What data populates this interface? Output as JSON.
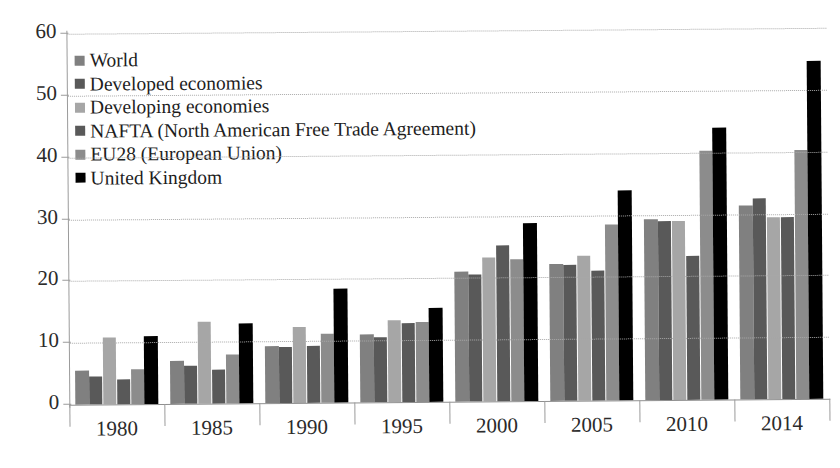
{
  "chart_data": {
    "type": "bar",
    "title": "",
    "subtitle": "",
    "xlabel": "",
    "ylabel": "",
    "ylim": [
      0,
      60
    ],
    "ytick_step": 10,
    "yticks": [
      "0",
      "10",
      "20",
      "30",
      "40",
      "50",
      "60"
    ],
    "grid": "horizontal-dotted",
    "legend_position": "inside-top-left",
    "categories": [
      "1980",
      "1985",
      "1990",
      "1995",
      "2000",
      "2005",
      "2010",
      "2014"
    ],
    "series": [
      {
        "name": "World",
        "color": "#808080",
        "values": [
          5.5,
          7.0,
          9.2,
          11.0,
          21.0,
          22.2,
          29.2,
          31.4
        ]
      },
      {
        "name": "Developed economies",
        "color": "#595959",
        "values": [
          4.6,
          6.2,
          9.0,
          10.5,
          20.5,
          22.0,
          29.0,
          32.5
        ]
      },
      {
        "name": "Developing economies",
        "color": "#a6a6a6",
        "values": [
          10.9,
          13.3,
          12.3,
          13.2,
          23.3,
          23.5,
          29.0,
          29.5
        ]
      },
      {
        "name": "NAFTA (North American Free Trade Agreement)",
        "color": "#595959",
        "values": [
          4.0,
          5.5,
          9.3,
          12.7,
          25.3,
          21.0,
          23.3,
          29.4
        ]
      },
      {
        "name": "EU28 (European Union)",
        "color": "#8c8c8c",
        "values": [
          5.6,
          8.0,
          11.2,
          13.0,
          23.0,
          28.5,
          40.3,
          40.3
        ]
      },
      {
        "name": "United Kingdom",
        "color": "#000000",
        "values": [
          11.0,
          12.9,
          18.5,
          15.2,
          28.8,
          34.0,
          44.0,
          54.7
        ]
      }
    ]
  },
  "legend": {
    "items": [
      {
        "label": "World"
      },
      {
        "label": "Developed economies"
      },
      {
        "label": "Developing economies"
      },
      {
        "label": "NAFTA (North American Free Trade Agreement)"
      },
      {
        "label": "EU28 (European Union)"
      },
      {
        "label": "United Kingdom"
      }
    ]
  }
}
